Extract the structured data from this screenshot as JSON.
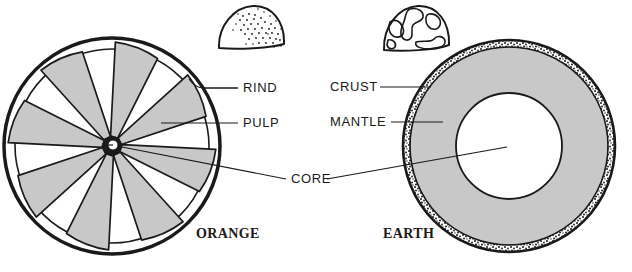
{
  "figure": {
    "width": 632,
    "height": 272,
    "background": "#ffffff",
    "ink_color": "#1a1a1a",
    "fill_gray": "#c8c8c8",
    "fill_white": "#ffffff"
  },
  "diagrams": [
    {
      "id": "orange",
      "caption": "ORANGE",
      "caption_x": 196,
      "caption_y": 238,
      "center_x": 112,
      "center_y": 146,
      "outer_radius": 108,
      "segment_count": 8,
      "parts": [
        {
          "name": "rind",
          "label": "RIND"
        },
        {
          "name": "pulp",
          "label": "PULP"
        },
        {
          "name": "core",
          "label": "CORE"
        }
      ],
      "inset": {
        "name": "orange-peel-wedge",
        "dots": 46
      }
    },
    {
      "id": "earth",
      "caption": "EARTH",
      "caption_x": 383,
      "caption_y": 238,
      "center_x": 509,
      "center_y": 146,
      "outer_radius": 106,
      "crust_thickness": 7,
      "core_radius": 53,
      "parts": [
        {
          "name": "crust",
          "label": "CRUST"
        },
        {
          "name": "mantle",
          "label": "MANTLE"
        },
        {
          "name": "core",
          "label": "CORE"
        }
      ],
      "inset": {
        "name": "earth-globe-wedge"
      }
    }
  ],
  "labels": [
    {
      "key": "rind",
      "text": "RIND",
      "x": 243,
      "y": 92,
      "anchor": "start"
    },
    {
      "key": "pulp",
      "text": "PULP",
      "x": 243,
      "y": 127,
      "anchor": "start"
    },
    {
      "key": "core",
      "text": "CORE",
      "x": 291,
      "y": 183,
      "anchor": "start"
    },
    {
      "key": "crust",
      "text": "CRUST",
      "x": 330,
      "y": 91,
      "anchor": "start"
    },
    {
      "key": "mantle",
      "text": "MANTLE",
      "x": 330,
      "y": 126,
      "anchor": "start"
    }
  ],
  "captions": [
    {
      "key": "orange",
      "text": "ORANGE"
    },
    {
      "key": "earth",
      "text": "EARTH"
    }
  ]
}
